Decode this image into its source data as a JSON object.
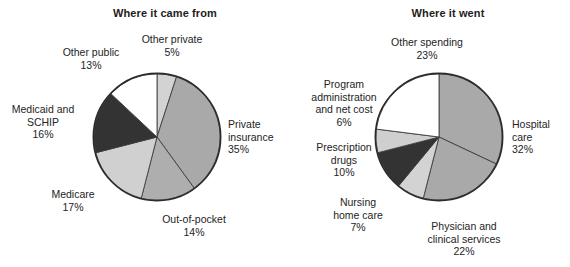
{
  "chart_data": [
    {
      "type": "pie",
      "title": "Where it came from",
      "start_angle": 0,
      "direction": "clockwise",
      "categories": [
        "Other private",
        "Private insurance",
        "Out-of-pocket",
        "Medicare",
        "Medicaid and SCHIP",
        "Other public"
      ],
      "values": [
        5,
        35,
        14,
        17,
        16,
        13
      ],
      "value_unit": "%",
      "colors": [
        "#d3d3d3",
        "#a9a9a9",
        "#aeaeae",
        "#d0d0d0",
        "#333333",
        "#ffffff"
      ],
      "labels": [
        {
          "name": "Other private",
          "text": "Other private\n5%"
        },
        {
          "name": "Private insurance",
          "text": "Private\ninsurance\n35%"
        },
        {
          "name": "Out-of-pocket",
          "text": "Out-of-pocket\n14%"
        },
        {
          "name": "Medicare",
          "text": "Medicare\n17%"
        },
        {
          "name": "Medicaid and SCHIP",
          "text": "Medicaid and\nSCHIP\n16%"
        },
        {
          "name": "Other public",
          "text": "Other public\n13%"
        }
      ],
      "legend": "none",
      "grid": false
    },
    {
      "type": "pie",
      "title": "Where it went",
      "start_angle": 0,
      "direction": "clockwise",
      "categories": [
        "Hospital care",
        "Physician and clinical services",
        "Nursing home care",
        "Prescription drugs",
        "Program administration and net cost",
        "Other spending"
      ],
      "values": [
        32,
        22,
        7,
        10,
        6,
        23
      ],
      "value_unit": "%",
      "colors": [
        "#a9a9a9",
        "#a9a9a9",
        "#d3d3d3",
        "#333333",
        "#cfcfcf",
        "#ffffff"
      ],
      "labels": [
        {
          "name": "Hospital care",
          "text": "Hospital\ncare\n32%"
        },
        {
          "name": "Physician and clinical services",
          "text": "Physician and\nclinical services\n22%"
        },
        {
          "name": "Nursing home care",
          "text": "Nursing\nhome care\n7%"
        },
        {
          "name": "Prescription drugs",
          "text": "Prescription\ndrugs\n10%"
        },
        {
          "name": "Program administration and net cost",
          "text": "Program\nadministration\nand net cost\n6%"
        },
        {
          "name": "Other spending",
          "text": "Other spending\n23%"
        }
      ],
      "legend": "none",
      "grid": false
    }
  ],
  "left": {
    "title": "Where it came from",
    "labels": {
      "other_private": "Other private\n5%",
      "private_insurance": "Private\ninsurance\n35%",
      "out_of_pocket": "Out-of-pocket\n14%",
      "medicare": "Medicare\n17%",
      "medicaid_schip": "Medicaid and\nSCHIP\n16%",
      "other_public": "Other public\n13%"
    }
  },
  "right": {
    "title": "Where it went",
    "labels": {
      "hospital_care": "Hospital\ncare\n32%",
      "physician": "Physician and\nclinical services\n22%",
      "nursing_home": "Nursing\nhome care\n7%",
      "prescription_drugs": "Prescription\ndrugs\n10%",
      "program_admin": "Program\nadministration\nand net cost\n6%",
      "other_spending": "Other spending\n23%"
    }
  }
}
